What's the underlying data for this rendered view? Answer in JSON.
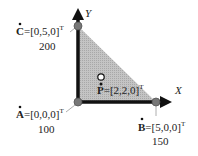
{
  "axes": {
    "x_label": "X",
    "y_label": "Y"
  },
  "points": {
    "A": {
      "name": "A",
      "coords": "=[0,0,0]",
      "sup": "T",
      "value": "100"
    },
    "B": {
      "name": "B",
      "coords": "=[5,0,0]",
      "sup": "T",
      "value": "150"
    },
    "C": {
      "name": "C",
      "coords": "=[0,5,0]",
      "sup": "T",
      "value": "200"
    },
    "P": {
      "name": "P",
      "coords": "=[2,2,0]",
      "sup": "T"
    }
  },
  "colors": {
    "triangle_fill": "#b8b8b8",
    "axis": "#111111",
    "vertex": "#777777",
    "leader": "#999999"
  }
}
